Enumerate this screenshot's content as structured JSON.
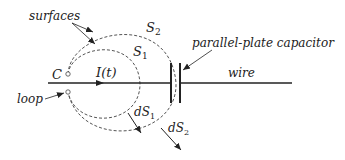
{
  "diagram": {
    "labels": {
      "surfaces": "surfaces",
      "s2": "S",
      "s2_sub": "2",
      "s1": "S",
      "s1_sub": "1",
      "capacitor": "parallel-plate capacitor",
      "c": "C",
      "current": "I(t)",
      "wire": "wire",
      "loop": "loop",
      "ds1": "dS",
      "ds1_sub": "1",
      "ds2": "dS",
      "ds2_sub": "2"
    },
    "colors": {
      "ink": "#222222",
      "dashed": "#555555",
      "background": "#ffffff"
    }
  }
}
